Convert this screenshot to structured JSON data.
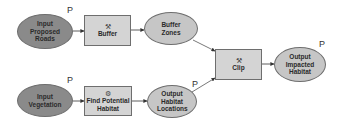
{
  "diagram": {
    "type": "model-builder-flowchart",
    "nodes": [
      {
        "id": "input_roads",
        "label": "Input Proposed Roads",
        "lines": [
          "Input",
          "Proposed",
          "Roads"
        ],
        "shape": "ellipse",
        "role": "input-data",
        "parameter": "P"
      },
      {
        "id": "buffer",
        "label": "Buffer",
        "lines": [
          "Buffer"
        ],
        "shape": "rectangle",
        "role": "tool",
        "icon": "hammer-icon"
      },
      {
        "id": "buffer_zones",
        "label": "Buffer Zones",
        "lines": [
          "Buffer",
          "Zones"
        ],
        "shape": "ellipse",
        "role": "derived-data"
      },
      {
        "id": "clip",
        "label": "Clip",
        "lines": [
          "Clip"
        ],
        "shape": "rectangle",
        "role": "tool",
        "icon": "hammer-icon"
      },
      {
        "id": "output_impacted",
        "label": "Output Impacted Habitat",
        "lines": [
          "Output",
          "Impacted",
          "Habitat"
        ],
        "shape": "ellipse",
        "role": "derived-data",
        "parameter": "P"
      },
      {
        "id": "input_veg",
        "label": "Input Vegetation",
        "lines": [
          "Input",
          "Vegetation"
        ],
        "shape": "ellipse",
        "role": "input-data",
        "parameter": "P"
      },
      {
        "id": "find_habitat",
        "label": "Find Potential Habitat",
        "lines": [
          "Find Potential",
          "Habitat"
        ],
        "shape": "rectangle",
        "role": "tool",
        "icon": "model-icon"
      },
      {
        "id": "output_locations",
        "label": "Output Habitat Locations",
        "lines": [
          "Output",
          "Habitat",
          "Locations"
        ],
        "shape": "ellipse",
        "role": "derived-data",
        "parameter": "P"
      }
    ],
    "edges": [
      {
        "from": "input_roads",
        "to": "buffer"
      },
      {
        "from": "buffer",
        "to": "buffer_zones"
      },
      {
        "from": "buffer_zones",
        "to": "clip"
      },
      {
        "from": "input_veg",
        "to": "find_habitat"
      },
      {
        "from": "find_habitat",
        "to": "output_locations"
      },
      {
        "from": "output_locations",
        "to": "clip"
      },
      {
        "from": "clip",
        "to": "output_impacted"
      }
    ],
    "parameter_marker": "P",
    "icons": {
      "tool": "⚒",
      "model": "⚙"
    },
    "colors": {
      "input_fill": "#8a8a8a",
      "derived_fill": "#c6c6c6",
      "tool_fill": "#d4d4d4",
      "stroke": "#6e6e6e",
      "edge": "#333333"
    }
  }
}
